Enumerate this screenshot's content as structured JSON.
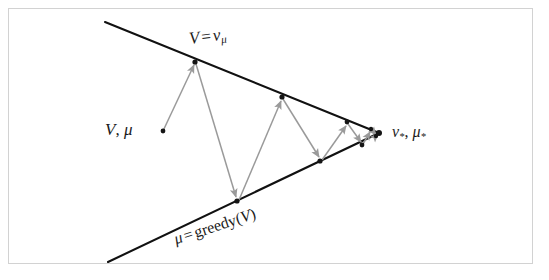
{
  "figure": {
    "background_color": "#ffffff",
    "frame_color": "#d2d2d2",
    "line_color": "#111111",
    "arrow_color": "#9a9a9a",
    "dot_color": "#151515",
    "width": 549,
    "height": 280
  },
  "labels": {
    "upper_line": {
      "id": "label-v-eq-vmu",
      "text": "V = v_mu",
      "parts": {
        "lhs": "V",
        "operator": "=",
        "rhs_base": "v",
        "rhs_sub": "μ"
      },
      "rotation_deg": -7,
      "x": 188,
      "y": 30
    },
    "lower_line": {
      "id": "label-greedy",
      "text": "μ = greedy(V)",
      "parts": {
        "lhs": "μ",
        "operator": "=",
        "rhs": "greedy(",
        "rhs_arg": "V",
        "rhs_close": ")"
      },
      "rotation_deg": -18,
      "x": 172,
      "y": 232
    },
    "start_point": {
      "id": "label-v-mu",
      "text": "V, μ",
      "parts": {
        "value": "V",
        "comma": ",",
        "policy": "μ"
      },
      "x": 105,
      "y": 121
    },
    "convergence_point": {
      "id": "label-vstar-mustar",
      "text": "v_*, μ_*",
      "parts": {
        "value_base": "v",
        "value_sub": "*",
        "comma": ",",
        "policy_base": "μ",
        "policy_sub": "*"
      },
      "x": 392,
      "y": 124
    }
  },
  "geometry": {
    "upper_line": {
      "x1": 105,
      "y1": 22,
      "x2": 379,
      "y2": 133
    },
    "lower_line": {
      "x1": 108,
      "y1": 262,
      "x2": 379,
      "y2": 133
    },
    "apex": {
      "x": 379,
      "y": 133
    },
    "start_dot": {
      "x": 163,
      "y": 131
    },
    "zigzag_vertices": [
      {
        "x": 163,
        "y": 131,
        "on": "interior"
      },
      {
        "x": 195,
        "y": 62,
        "on": "upper"
      },
      {
        "x": 237,
        "y": 201,
        "on": "lower"
      },
      {
        "x": 282,
        "y": 97,
        "on": "upper"
      },
      {
        "x": 320,
        "y": 161,
        "on": "lower"
      },
      {
        "x": 347,
        "y": 122,
        "on": "upper"
      },
      {
        "x": 362,
        "y": 145,
        "on": "lower"
      },
      {
        "x": 371,
        "y": 129,
        "on": "upper"
      },
      {
        "x": 376,
        "y": 136,
        "on": "lower"
      },
      {
        "x": 379,
        "y": 133,
        "on": "apex"
      }
    ],
    "dots_on_lines": [
      {
        "x": 195,
        "y": 62
      },
      {
        "x": 237,
        "y": 201
      },
      {
        "x": 282,
        "y": 97
      },
      {
        "x": 320,
        "y": 161
      },
      {
        "x": 347,
        "y": 122
      },
      {
        "x": 362,
        "y": 145
      },
      {
        "x": 371,
        "y": 129
      },
      {
        "x": 376,
        "y": 136
      },
      {
        "x": 379,
        "y": 133
      }
    ]
  }
}
